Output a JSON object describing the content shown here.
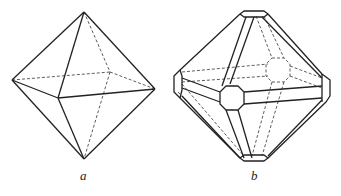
{
  "figures": [
    {
      "id": "a",
      "label": "a",
      "description": "octahedron"
    },
    {
      "id": "b",
      "label": "b",
      "description": "octahedron truncated at vertices and bevelled at edges"
    }
  ],
  "colors": {
    "line": "#222222",
    "background": "#ffffff"
  }
}
